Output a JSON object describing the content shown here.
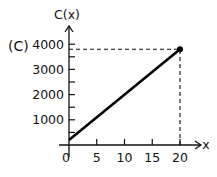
{
  "panel_label": "(C)",
  "chart_data": {
    "type": "line",
    "title": "",
    "xlabel": "x",
    "ylabel": "C(x)",
    "x": [
      0,
      20
    ],
    "series": [
      {
        "name": "C(x)",
        "values": [
          200,
          3800
        ]
      }
    ],
    "xticks": [
      0,
      5,
      10,
      15,
      20
    ],
    "xtick_labels": [
      "0",
      "5",
      "10",
      "15",
      "20"
    ],
    "yticks": [
      1000,
      2000,
      3000,
      4000
    ],
    "ytick_labels": [
      "1000",
      "2000",
      "3000",
      "4000"
    ],
    "yminor_ticks": [
      500,
      1500,
      2500,
      3500
    ],
    "xlim": [
      0,
      21
    ],
    "ylim": [
      0,
      4300
    ],
    "grid": false,
    "legend": null,
    "annotations": [
      {
        "type": "point",
        "x": 20,
        "y": 3800,
        "style": "filled-dot"
      },
      {
        "type": "dashed-guide",
        "from": [
          0,
          3800
        ],
        "to": [
          20,
          3800
        ]
      },
      {
        "type": "dashed-guide",
        "from": [
          20,
          0
        ],
        "to": [
          20,
          3800
        ]
      }
    ]
  }
}
